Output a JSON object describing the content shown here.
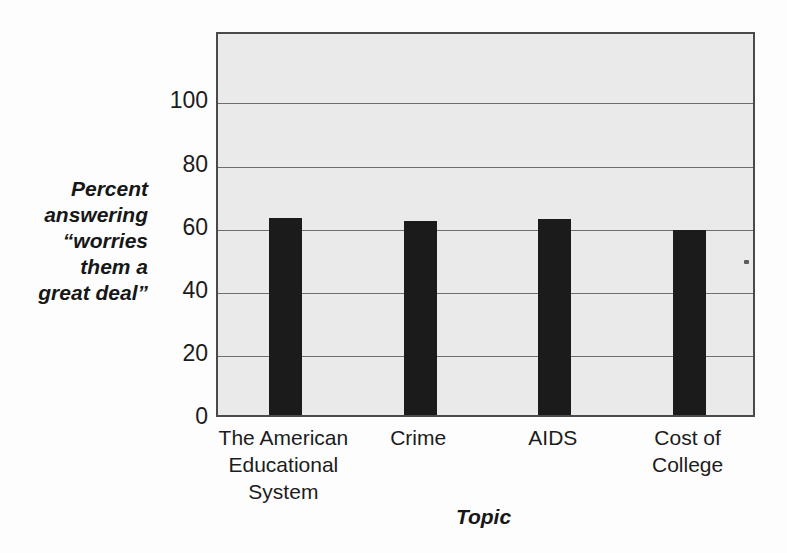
{
  "chart_data": {
    "type": "bar",
    "title": "",
    "subtitle": "",
    "categories": [
      "The American Educational System",
      "Crime",
      "AIDS",
      "Cost of College"
    ],
    "category_lines": [
      [
        "The American",
        "Educational",
        "System"
      ],
      [
        "Crime"
      ],
      [
        "AIDS"
      ],
      [
        "Cost of",
        "College"
      ]
    ],
    "values": [
      62.5,
      61.5,
      62,
      58.5
    ],
    "xlabel": "Topic",
    "ylabel": "Percent answering “worries them a great deal”",
    "ylabel_lines": [
      "Percent",
      "answering",
      "“worries",
      "them a",
      "great deal”"
    ],
    "ylim": [
      0,
      122
    ],
    "yticks": [
      0,
      20,
      40,
      60,
      80,
      100
    ],
    "ytick_labels": [
      "0",
      "20",
      "40",
      "60",
      "80",
      "100"
    ],
    "grid": true,
    "legend": null,
    "colors": {
      "bar": "#1b1b1b",
      "plot_background": "#eaeaea",
      "plot_border": "#4a4a4a",
      "gridline": "#6e6e6e",
      "text": "#1c1c1c",
      "page_background": "#fdfdfd"
    }
  }
}
